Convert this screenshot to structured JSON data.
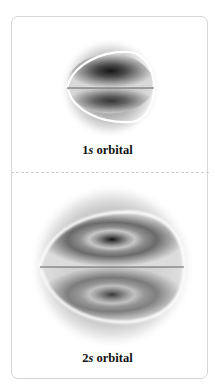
{
  "figure": {
    "panels": [
      {
        "id": "1s",
        "label_number": "1",
        "label_letter": "s",
        "label_rest": " orbital",
        "shell_nodes": 0
      },
      {
        "id": "2s",
        "label_number": "2",
        "label_letter": "s",
        "label_rest": " orbital",
        "shell_nodes": 1
      }
    ],
    "colors": {
      "border": "#d6d6d6",
      "divider": "#cfcfcf",
      "density_dark": "#1a1a1a",
      "text": "#111111"
    }
  }
}
